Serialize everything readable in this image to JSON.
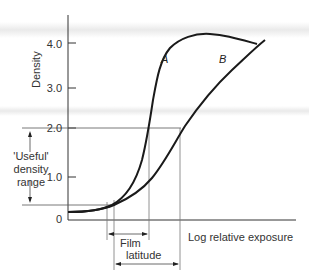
{
  "figure": {
    "y_axis_label": "Density",
    "x_axis_label": "Log relative exposure",
    "y_ticks": [
      "4.0",
      "3.0",
      "2.0",
      "1.0",
      "0"
    ],
    "curves": [
      {
        "name": "A"
      },
      {
        "name": "B"
      }
    ],
    "annotations": {
      "useful_line1": "'Useful'",
      "useful_line2": "density",
      "useful_line3": "range",
      "film_latitude_line1": "Film",
      "film_latitude_line2": "latitude"
    },
    "colors": {
      "curve": "#1a1a1a",
      "axis": "#333333",
      "guide": "#555555"
    }
  }
}
